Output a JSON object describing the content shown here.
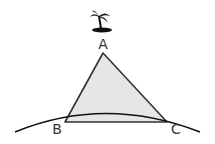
{
  "diagram": {
    "vertices": {
      "a": "A",
      "b": "B",
      "c": "C"
    },
    "icon": "palm-tree-island-icon",
    "colors": {
      "triangle_fill": "#e6e6e6",
      "stroke": "#222222"
    }
  }
}
